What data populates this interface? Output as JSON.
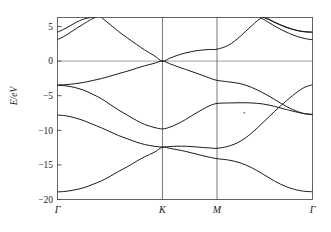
{
  "figure": {
    "title": "",
    "ylabel": "E/eV"
  },
  "axes": {
    "y_ticks": [
      {
        "value": 5,
        "label": "5"
      },
      {
        "value": 0,
        "label": "0"
      },
      {
        "value": -5,
        "label": "−5"
      },
      {
        "value": -10,
        "label": "−10"
      },
      {
        "value": -15,
        "label": "−15"
      },
      {
        "value": -20,
        "label": "−20"
      }
    ],
    "x_ticks": [
      {
        "pos": 0.0,
        "label": "Γ"
      },
      {
        "pos": 1.0,
        "label": "K"
      },
      {
        "pos": 1.52,
        "label": "M"
      },
      {
        "pos": 2.43,
        "label": "Γ"
      }
    ]
  },
  "chart_data": {
    "type": "line",
    "title": "",
    "xlabel": "",
    "ylabel": "E/eV",
    "ylim": [
      -20,
      6.3
    ],
    "xlim": [
      0,
      2.43
    ],
    "grid": false,
    "legend": "none",
    "high_symmetry_points": [
      "Γ",
      "K",
      "M",
      "Γ"
    ],
    "high_symmetry_x": [
      0.0,
      1.0,
      1.52,
      2.43
    ],
    "line_color": "#1a1a1a",
    "line_width": 1.0,
    "note": "Electronic band structure along Γ-K-M-Γ; Dirac crossing at K at E=0 eV.",
    "series": [
      {
        "name": "band-1-lowest-sigma",
        "comment": "lowest valence band, -18.9 eV at Gamma rising to -12.4 eV at K",
        "x": [
          0.0,
          0.08,
          0.16,
          0.25,
          0.33,
          0.42,
          0.5,
          0.58,
          0.67,
          0.75,
          0.83,
          0.92,
          1.0,
          1.07,
          1.14,
          1.22,
          1.3,
          1.38,
          1.45,
          1.52,
          1.63,
          1.74,
          1.85,
          1.96,
          2.07,
          2.18,
          2.29,
          2.36,
          2.43
        ],
        "y": [
          -18.9,
          -18.82,
          -18.62,
          -18.3,
          -17.85,
          -17.3,
          -16.66,
          -15.96,
          -15.23,
          -14.5,
          -13.83,
          -13.2,
          -12.45,
          -12.6,
          -12.8,
          -13.05,
          -13.35,
          -13.65,
          -13.9,
          -14.1,
          -14.3,
          -14.7,
          -15.4,
          -16.35,
          -17.35,
          -18.15,
          -18.65,
          -18.82,
          -18.88
        ]
      },
      {
        "name": "band-2-sigma",
        "comment": "second valence band, -7.8 eV at Gamma, dips to -12.4 eV at K, -12.6 at M, rises to -3.4 at Gamma",
        "x": [
          0.0,
          0.08,
          0.16,
          0.25,
          0.33,
          0.42,
          0.5,
          0.58,
          0.67,
          0.75,
          0.83,
          0.92,
          1.0,
          1.07,
          1.14,
          1.22,
          1.3,
          1.38,
          1.45,
          1.52,
          1.63,
          1.74,
          1.85,
          1.96,
          2.07,
          2.18,
          2.29,
          2.36,
          2.43
        ],
        "y": [
          -7.8,
          -7.9,
          -8.18,
          -8.6,
          -9.1,
          -9.65,
          -10.2,
          -10.75,
          -11.25,
          -11.7,
          -12.05,
          -12.3,
          -12.42,
          -12.35,
          -12.3,
          -12.3,
          -12.38,
          -12.48,
          -12.55,
          -12.6,
          -12.3,
          -11.6,
          -10.4,
          -8.85,
          -7.25,
          -5.75,
          -4.4,
          -3.75,
          -3.42
        ]
      },
      {
        "name": "band-3-sigma",
        "comment": "third valence band, -7.8/-3.5 region at Gamma, -9.8 at K, -6.1 at M, -7.6 at Gamma",
        "x": [
          0.0,
          0.08,
          0.16,
          0.25,
          0.33,
          0.42,
          0.5,
          0.58,
          0.67,
          0.75,
          0.83,
          0.92,
          1.0,
          1.07,
          1.14,
          1.22,
          1.3,
          1.38,
          1.45,
          1.52,
          1.63,
          1.74,
          1.85,
          1.96,
          2.07,
          2.18,
          2.29,
          2.36,
          2.43
        ],
        "y": [
          -3.5,
          -3.58,
          -3.8,
          -4.2,
          -4.75,
          -5.45,
          -6.25,
          -7.05,
          -7.85,
          -8.55,
          -9.15,
          -9.58,
          -9.8,
          -9.55,
          -9.1,
          -8.45,
          -7.7,
          -7.0,
          -6.45,
          -6.12,
          -6.05,
          -6.02,
          -6.05,
          -6.2,
          -6.55,
          -7.0,
          -7.4,
          -7.6,
          -7.68
        ]
      },
      {
        "name": "band-4-pi-valence",
        "comment": "pi valence band, -3.5 eV at Gamma up to 0 eV at K (Dirac), -3.0 at M, -3.4 at Gamma",
        "x": [
          0.0,
          0.08,
          0.16,
          0.25,
          0.33,
          0.42,
          0.5,
          0.58,
          0.67,
          0.75,
          0.83,
          0.92,
          1.0,
          1.07,
          1.14,
          1.22,
          1.3,
          1.38,
          1.45,
          1.52,
          1.63,
          1.74,
          1.85,
          1.96,
          2.07,
          2.18,
          2.29,
          2.36,
          2.43
        ],
        "y": [
          -3.45,
          -3.4,
          -3.28,
          -3.08,
          -2.82,
          -2.52,
          -2.18,
          -1.82,
          -1.44,
          -1.05,
          -0.68,
          -0.33,
          0.0,
          -0.38,
          -0.78,
          -1.2,
          -1.62,
          -2.05,
          -2.45,
          -2.78,
          -3.0,
          -3.25,
          -3.8,
          -4.6,
          -5.55,
          -6.55,
          -7.3,
          -7.62,
          -7.75
        ]
      },
      {
        "name": "band-5-pi-conduction",
        "comment": "pi* conduction band from Gamma above frame, through K Dirac point at 0 eV, 1.7 at M, peak 6.3 between M and Gamma",
        "x": [
          0.0,
          0.06,
          0.12,
          0.18,
          0.25,
          0.33,
          0.42,
          0.5,
          0.58,
          0.67,
          0.75,
          0.83,
          0.92,
          1.0,
          1.07,
          1.14,
          1.22,
          1.3,
          1.38,
          1.45,
          1.52,
          1.63,
          1.74,
          1.85,
          1.96,
          2.07,
          2.18,
          2.29,
          2.36,
          2.43
        ],
        "y": [
          12.8,
          11.9,
          10.95,
          9.95,
          8.8,
          7.55,
          6.3,
          5.3,
          4.3,
          3.3,
          2.45,
          1.62,
          0.8,
          0.0,
          0.42,
          0.82,
          1.18,
          1.44,
          1.6,
          1.68,
          1.72,
          2.3,
          3.55,
          5.1,
          6.3,
          5.6,
          4.92,
          4.4,
          4.22,
          4.18
        ]
      },
      {
        "name": "band-6-sigma-star",
        "comment": "sigma* band, 4.2 eV at Gamma rising to peak 6.3 near 0.33 of Gamma-K",
        "x": [
          0.0,
          0.06,
          0.12,
          0.18,
          0.24,
          0.3,
          0.33,
          0.36
        ],
        "y": [
          4.18,
          4.6,
          5.1,
          5.62,
          6.02,
          6.25,
          6.3,
          6.32
        ]
      },
      {
        "name": "band-7-sigma-star-lower",
        "comment": "second sigma* band, 3.1 eV at Gamma rising off-frame near K",
        "x": [
          0.0,
          0.06,
          0.12,
          0.18,
          0.24,
          0.3,
          0.33,
          0.36
        ],
        "y": [
          3.1,
          3.55,
          4.12,
          4.72,
          5.28,
          5.85,
          6.1,
          6.32
        ]
      },
      {
        "name": "band-8-sigma-star-right",
        "comment": "sigma* band descending from peak toward Gamma at right, 4.2 eV",
        "x": [
          1.96,
          2.02,
          2.09,
          2.16,
          2.23,
          2.3,
          2.37,
          2.43
        ],
        "y": [
          6.32,
          5.95,
          5.45,
          4.98,
          4.62,
          4.38,
          4.24,
          4.18
        ]
      },
      {
        "name": "band-9-sigma-star-right-lower",
        "comment": "lower sigma* band descending toward Gamma at right, 3.1 eV",
        "x": [
          1.93,
          2.0,
          2.07,
          2.14,
          2.21,
          2.28,
          2.35,
          2.43
        ],
        "y": [
          6.32,
          5.7,
          5.05,
          4.48,
          3.98,
          3.58,
          3.28,
          3.08
        ]
      }
    ],
    "annotations": [
      {
        "name": "stray-speck",
        "x": 1.78,
        "y": -7.45,
        "type": "dot"
      }
    ]
  }
}
